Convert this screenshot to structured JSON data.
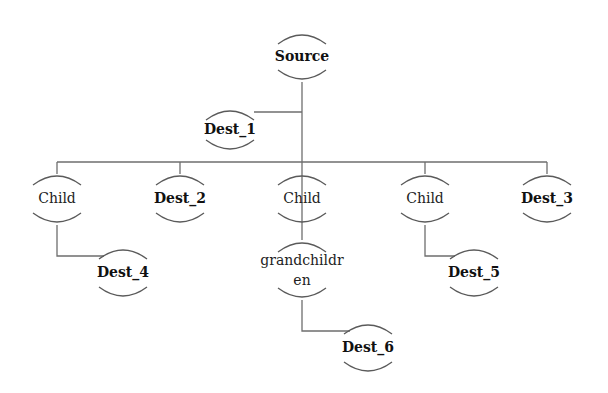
{
  "diagram": {
    "type": "tree",
    "nodes": [
      {
        "id": "source",
        "label": "Source",
        "bold": true,
        "x": 302,
        "y": 57,
        "r": 25
      },
      {
        "id": "dest_1",
        "label": "Dest_1",
        "bold": true,
        "x": 230,
        "y": 130,
        "r": 22
      },
      {
        "id": "child_1",
        "label": "Child",
        "bold": false,
        "x": 57,
        "y": 199,
        "r": 26
      },
      {
        "id": "dest_2",
        "label": "Dest_2",
        "bold": true,
        "x": 180,
        "y": 199,
        "r": 26
      },
      {
        "id": "child_2",
        "label": "Child",
        "bold": false,
        "x": 302,
        "y": 199,
        "r": 26
      },
      {
        "id": "child_3",
        "label": "Child",
        "bold": false,
        "x": 425,
        "y": 199,
        "r": 26
      },
      {
        "id": "dest_3",
        "label": "Dest_3",
        "bold": true,
        "x": 547,
        "y": 199,
        "r": 26
      },
      {
        "id": "dest_4",
        "label": "Dest_4",
        "bold": true,
        "x": 123,
        "y": 273,
        "r": 26
      },
      {
        "id": "grandchildren",
        "label": "grandchildr",
        "label2": "en",
        "bold": false,
        "x": 302,
        "y": 270,
        "r": 30
      },
      {
        "id": "dest_5",
        "label": "Dest_5",
        "bold": true,
        "x": 474,
        "y": 273,
        "r": 26
      },
      {
        "id": "dest_6",
        "label": "Dest_6",
        "bold": true,
        "x": 368,
        "y": 348,
        "r": 26
      }
    ],
    "edges": [
      {
        "from": "source",
        "to": "dest_1"
      },
      {
        "from": "source",
        "to": "child_1"
      },
      {
        "from": "source",
        "to": "dest_2"
      },
      {
        "from": "source",
        "to": "child_2"
      },
      {
        "from": "source",
        "to": "child_3"
      },
      {
        "from": "source",
        "to": "dest_3"
      },
      {
        "from": "child_1",
        "to": "dest_4"
      },
      {
        "from": "child_2",
        "to": "grandchildren"
      },
      {
        "from": "child_3",
        "to": "dest_5"
      },
      {
        "from": "grandchildren",
        "to": "dest_6"
      }
    ]
  }
}
